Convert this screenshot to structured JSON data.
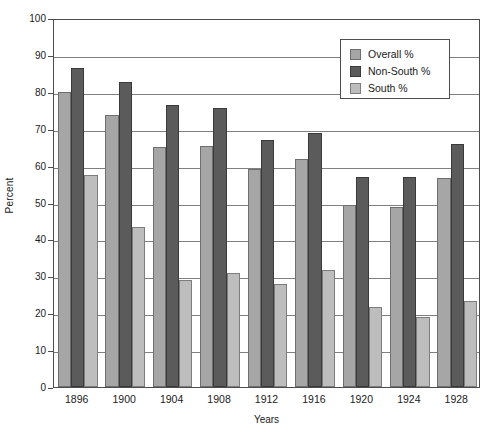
{
  "chart_data": {
    "type": "bar",
    "title": "",
    "xlabel": "Years",
    "ylabel": "Percent",
    "ylim": [
      0,
      100
    ],
    "yticks": [
      0,
      10,
      20,
      30,
      40,
      50,
      60,
      70,
      80,
      90,
      100
    ],
    "grid": true,
    "legend_position": "top-right",
    "categories": [
      "1896",
      "1900",
      "1904",
      "1908",
      "1912",
      "1916",
      "1920",
      "1924",
      "1928"
    ],
    "series": [
      {
        "name": "Overall %",
        "color": "#a6a6a6",
        "values": [
          80.0,
          73.6,
          65.0,
          65.4,
          59.0,
          61.8,
          49.2,
          48.9,
          56.6
        ]
      },
      {
        "name": "Non-South %",
        "color": "#5b5b5b",
        "values": [
          86.4,
          82.6,
          76.3,
          75.5,
          67.0,
          68.9,
          57.0,
          57.0,
          65.9
        ]
      },
      {
        "name": "South %",
        "color": "#bdbdbd",
        "values": [
          57.4,
          43.3,
          29.0,
          30.8,
          27.8,
          31.7,
          21.7,
          18.9,
          23.2
        ]
      }
    ]
  },
  "legend": {
    "items": [
      {
        "label": "Overall %"
      },
      {
        "label": "Non-South %"
      },
      {
        "label": "South %"
      }
    ]
  },
  "caption": {
    "text": ""
  }
}
